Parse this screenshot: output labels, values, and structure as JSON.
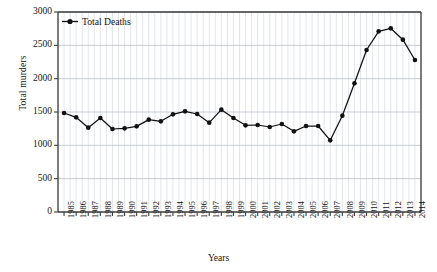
{
  "chart_data": {
    "type": "line",
    "title": "",
    "xlabel": "Years",
    "ylabel": "Total murders",
    "legend": [
      "Total Deaths"
    ],
    "legend_position": "top-left-inside",
    "grid": true,
    "ylim": [
      0,
      3000
    ],
    "yticks": [
      0,
      500,
      1000,
      1500,
      2000,
      2500,
      3000
    ],
    "ytick_labels": [
      "0",
      "500",
      "1000",
      "1500",
      "2000",
      "2500",
      "3000"
    ],
    "categories": [
      "1985",
      "1986",
      "1987",
      "1988",
      "1989",
      "1990",
      "1991",
      "1992",
      "1993",
      "1994",
      "1995",
      "1996",
      "1997",
      "1998",
      "1999",
      "2000",
      "2001",
      "2002",
      "2003",
      "2004",
      "2005",
      "2006",
      "2007",
      "2008",
      "2009",
      "2010",
      "2011",
      "2012",
      "2013",
      "2014"
    ],
    "series": [
      {
        "name": "Total Deaths",
        "color": "#111111",
        "marker": "circle",
        "values": [
          1485,
          1420,
          1265,
          1410,
          1245,
          1255,
          1285,
          1385,
          1360,
          1465,
          1510,
          1470,
          1340,
          1535,
          1410,
          1300,
          1305,
          1275,
          1320,
          1210,
          1290,
          1290,
          1075,
          1445,
          1930,
          2430,
          2710,
          2755,
          2585,
          2280
        ]
      }
    ]
  },
  "axes": {
    "ylabel_text": "Total murders",
    "xlabel_text": "Years"
  },
  "legend": {
    "entries": [
      {
        "label": "Total Deaths"
      }
    ]
  },
  "colors": {
    "series": "#111111",
    "grid_major": "#b9c0cc",
    "grid_minor": "#d6dbe3",
    "frame": "#3c3c3c",
    "text": "#141414",
    "background": "#ffffff"
  }
}
